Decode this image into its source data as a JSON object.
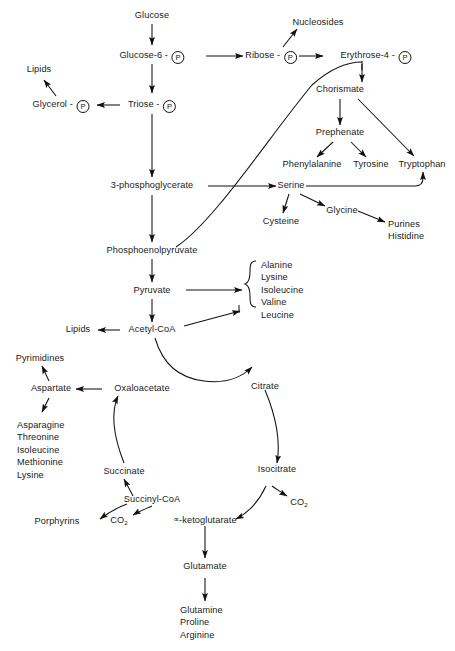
{
  "diagram": {
    "type": "metabolic-pathway-diagram",
    "background_color": "#ffffff",
    "line_color": "#111111",
    "text_color": "#1a1a1a"
  },
  "nodes": {
    "glucose": "Glucose",
    "glucose6p_text": "Glucose-6 - ",
    "glucose6p_badge": "P",
    "ribose_text": "Ribose - ",
    "ribose_badge": "P",
    "erythrose_text": "Erythrose-4 - ",
    "erythrose_badge": "P",
    "nucleosides": "Nucleosides",
    "chorismate": "Chorismate",
    "prephenate": "Prephenate",
    "phenylalanine": "Phenylalanine",
    "tyrosine": "Tyrosine",
    "tryptophan": "Tryptophan",
    "lipids_top": "Lipids",
    "glycerol_text": "Glycerol - ",
    "glycerol_badge": "P",
    "triose_text": "Triose - ",
    "triose_badge": "P",
    "pg3": "3-phosphoglycerate",
    "serine": "Serine",
    "cysteine": "Cysteine",
    "glycine": "Glycine",
    "purines_histidine": "Purines\nHistidine",
    "pep": "Phosphoenolpyruvate",
    "pyruvate": "Pyruvate",
    "branch_aminos": "Alanine\nLysine\nIsoleucine\nValine\nLeucine",
    "lipids_mid": "Lipids",
    "acetyl_coa": "Acetyl-CoA",
    "citrate": "Citrate",
    "isocitrate": "Isocitrate",
    "ketoglutarate_alpha": "∝",
    "ketoglutarate_text": "-ketoglutarate",
    "succinyl_coa": "Succinyl-CoA",
    "succinate": "Succinate",
    "oxaloacetate": "Oxaloacetate",
    "aspartate": "Aspartate",
    "pyrimidines": "Pyrimidines",
    "aspartate_family": "Asparagine\nThreonine\nIsoleucine\nMethionine\nLysine",
    "porphyrins": "Porphyrins",
    "co2_succinyl": "CO",
    "co2_succinyl_sub": "2",
    "co2_isocitrate": "CO",
    "co2_isocitrate_sub": "2",
    "glutamate": "Glutamate",
    "glutamate_family": "Glutamine\nProline\nArginine"
  }
}
